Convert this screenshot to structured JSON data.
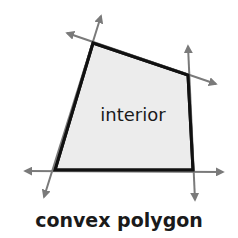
{
  "diagram": {
    "caption": "convex polygon",
    "interior_label": "interior",
    "colors": {
      "fill": "#ececec",
      "edge": "#111111",
      "line": "#7a7a7a",
      "text": "#1a1a1a"
    },
    "vertices": [
      {
        "name": "top-left",
        "x": 93,
        "y": 43
      },
      {
        "name": "top-right",
        "x": 188,
        "y": 75
      },
      {
        "name": "bottom-right",
        "x": 193,
        "y": 170
      },
      {
        "name": "bottom-left",
        "x": 55,
        "y": 170
      }
    ]
  }
}
